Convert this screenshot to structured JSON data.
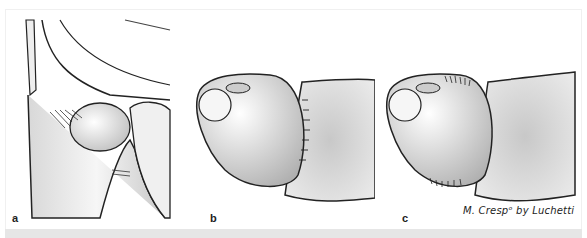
{
  "figure": {
    "panels": [
      {
        "id": "a",
        "label": "a",
        "description": "Lateral view of joint with ligament fibers"
      },
      {
        "id": "b",
        "label": "b",
        "description": "Joint with intact capsule fibers"
      },
      {
        "id": "c",
        "label": "c",
        "description": "Joint with frayed capsule fibers"
      }
    ],
    "credit": "M. Crespᵒ by Luchetti"
  },
  "colors": {
    "background": "#ffffff",
    "line": "#1a1a1a",
    "bone_light": "#f4f4f4",
    "bone_shade": "#b8b8b8",
    "bottom_bar": "#e6e6e6"
  }
}
